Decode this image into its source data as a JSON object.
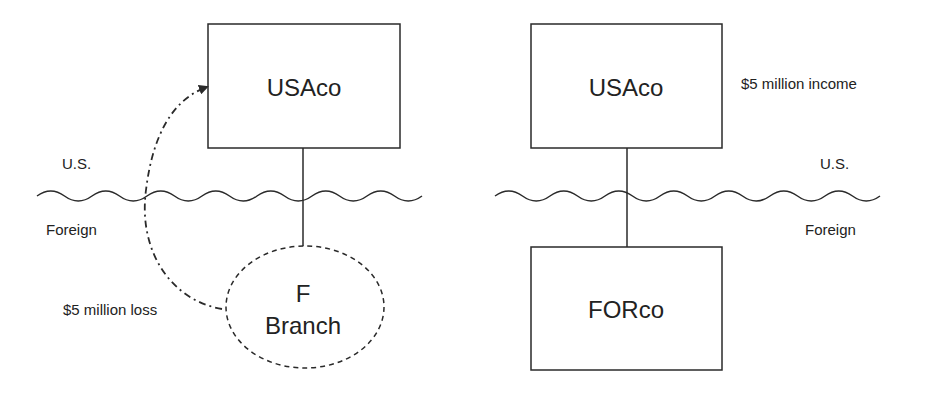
{
  "left_panel": {
    "parent_entity": {
      "label": "USAco",
      "shape": "rectangle"
    },
    "child_entity": {
      "line1": "F",
      "line2": "Branch",
      "shape": "dashed-ellipse"
    },
    "border_labels": {
      "upper": "U.S.",
      "lower": "Foreign"
    },
    "flow_annotation": "$5 million loss",
    "flow_direction": "F Branch loss flows up to USAco (dash-dot arrow)"
  },
  "right_panel": {
    "parent_entity": {
      "label": "USAco",
      "shape": "rectangle"
    },
    "child_entity": {
      "label": "FORco",
      "shape": "rectangle"
    },
    "border_labels": {
      "upper": "U.S.",
      "lower": "Foreign"
    },
    "income_annotation": "$5 million income"
  },
  "colors": {
    "stroke": "#2a2a2a",
    "text": "#222222",
    "background": "#ffffff"
  }
}
